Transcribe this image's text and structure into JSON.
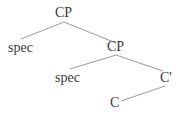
{
  "tree": {
    "root": {
      "label": "CP"
    },
    "root_spec": {
      "label": "spec"
    },
    "inner_cp": {
      "label": "CP"
    },
    "inner_spec": {
      "label": "spec"
    },
    "c_bar": {
      "label": "C'"
    },
    "c_head": {
      "label": "C"
    }
  },
  "edges": [
    {
      "from": "root",
      "to": "root_spec"
    },
    {
      "from": "root",
      "to": "inner_cp"
    },
    {
      "from": "inner_cp",
      "to": "inner_spec"
    },
    {
      "from": "inner_cp",
      "to": "c_bar"
    },
    {
      "from": "c_bar",
      "to": "c_head"
    }
  ],
  "colors": {
    "line": "#9a9a9a",
    "text": "#3a3a3a"
  }
}
